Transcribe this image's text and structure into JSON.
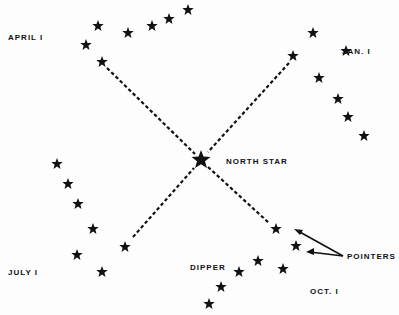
{
  "labels": {
    "april": "APRIL I",
    "jan": "JAN. I",
    "july": "JULY I",
    "oct": "OCT. I",
    "north_star": "NORTH STAR",
    "dipper": "DIPPER",
    "pointers": "POINTERS"
  },
  "colors": {
    "ink": "#111111",
    "background": "#fdfdfd"
  },
  "north_star": {
    "x": 201,
    "y": 160
  },
  "groups": [
    {
      "name": "april",
      "stars": [
        [
          86,
          45
        ],
        [
          98,
          26
        ],
        [
          102,
          62
        ],
        [
          128,
          33
        ],
        [
          152,
          26
        ],
        [
          169,
          19
        ],
        [
          188,
          10
        ]
      ],
      "line": [
        [
          107,
          68
        ],
        [
          195,
          154
        ]
      ]
    },
    {
      "name": "jan",
      "stars": [
        [
          293,
          56
        ],
        [
          313,
          33
        ],
        [
          346,
          51
        ],
        [
          319,
          78
        ],
        [
          338,
          99
        ],
        [
          348,
          117
        ],
        [
          364,
          136
        ]
      ],
      "line": [
        [
          289,
          63
        ],
        [
          208,
          152
        ]
      ]
    },
    {
      "name": "july",
      "stars": [
        [
          57,
          164
        ],
        [
          68,
          184
        ],
        [
          78,
          204
        ],
        [
          93,
          229
        ],
        [
          77,
          255
        ],
        [
          102,
          272
        ],
        [
          125,
          247
        ]
      ],
      "line": [
        [
          133,
          237
        ],
        [
          194,
          168
        ]
      ]
    },
    {
      "name": "oct",
      "stars": [
        [
          276,
          229
        ],
        [
          296,
          246
        ],
        [
          258,
          261
        ],
        [
          239,
          272
        ],
        [
          283,
          269
        ],
        [
          221,
          287
        ],
        [
          209,
          304
        ]
      ],
      "line": [
        [
          208,
          167
        ],
        [
          269,
          223
        ]
      ]
    }
  ]
}
